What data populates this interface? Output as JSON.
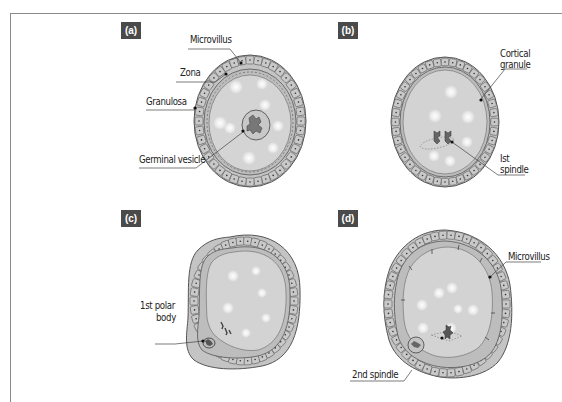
{
  "figure": {
    "colors": {
      "frame_line": "#8a8a8a",
      "tag_bg": "#4a4a4a",
      "tag_text": "#ffffff",
      "cell_fill": "#c9c9c9",
      "cell_stroke": "#5a5a5a",
      "zona_fill": "#bdbdbd",
      "ooplasm_fill": "#d3d3d3",
      "leader_line": "#444444",
      "text": "#222222"
    },
    "panels": [
      {
        "id": "a",
        "tag": "(a)",
        "labels": {
          "microvillus": "Microvillus",
          "zona": "Zona",
          "granulosa": "Granulosa",
          "germinal_vesicle": "Germinal vesicle"
        }
      },
      {
        "id": "b",
        "tag": "(b)",
        "labels": {
          "cortical_line1": "Cortical",
          "cortical_line2": "granule",
          "spindle_line1": "Ist",
          "spindle_line2": "spindle"
        }
      },
      {
        "id": "c",
        "tag": "(c)",
        "labels": {
          "polar_line1": "1st polar",
          "polar_line2": "body"
        }
      },
      {
        "id": "d",
        "tag": "(d)",
        "labels": {
          "microvillus": "Microvillus",
          "second_spindle": "2nd spindle"
        }
      }
    ]
  }
}
